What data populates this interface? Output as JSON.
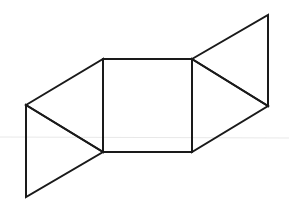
{
  "diagram": {
    "stroke_color": "#1a1a1a",
    "background": "#ffffff",
    "artifact_line_color": "#e6e6e6",
    "vertices": {
      "sq_tl": [
        103,
        59
      ],
      "sq_tr": [
        192,
        59
      ],
      "sq_br": [
        192,
        152
      ],
      "sq_bl": [
        103,
        152
      ],
      "left_apex": [
        26,
        105
      ],
      "left_bottom": [
        26,
        197
      ],
      "right_top": [
        268,
        15
      ],
      "right_apex": [
        268,
        106
      ]
    },
    "shapes": [
      {
        "name": "central-square",
        "points": [
          "sq_tl",
          "sq_tr",
          "sq_br",
          "sq_bl"
        ]
      },
      {
        "name": "upper-left-triangle",
        "points": [
          "left_apex",
          "sq_tl",
          "sq_bl"
        ]
      },
      {
        "name": "lower-left-triangle",
        "points": [
          "left_apex",
          "sq_bl",
          "left_bottom"
        ]
      },
      {
        "name": "upper-right-triangle",
        "points": [
          "sq_tr",
          "right_top",
          "right_apex"
        ]
      },
      {
        "name": "lower-right-triangle",
        "points": [
          "sq_tr",
          "right_apex",
          "sq_br"
        ]
      }
    ]
  }
}
